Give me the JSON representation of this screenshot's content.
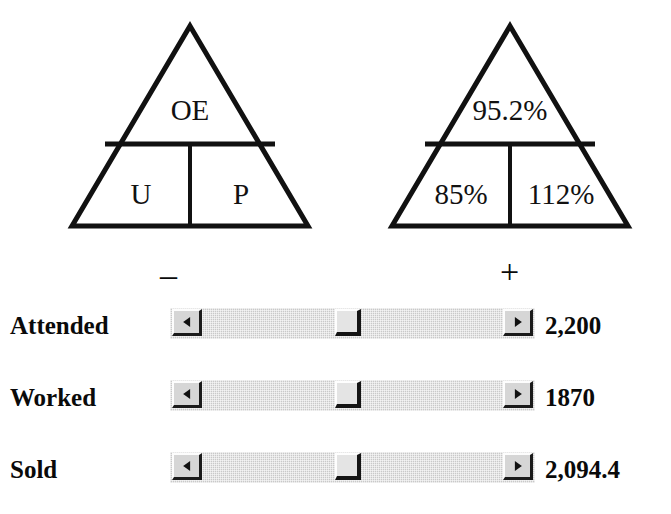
{
  "diagrams": [
    {
      "name": "productivity-pyramid-abbreviations",
      "top_cell": "OE",
      "bottom_left_cell": "U",
      "bottom_right_cell": "P"
    },
    {
      "name": "productivity-pyramid-values",
      "top_cell": "95.2%",
      "bottom_left_cell": "85%",
      "bottom_right_cell": "112%"
    }
  ],
  "sliders": {
    "minus_sign": "–",
    "plus_sign": "+",
    "left_arrow_icon": "triangle-left-icon",
    "right_arrow_icon": "triangle-right-icon",
    "rows": [
      {
        "label": "Attended",
        "value": "2,200"
      },
      {
        "label": "Worked",
        "value": "1870"
      },
      {
        "label": "Sold",
        "value": "2,094.4"
      }
    ]
  },
  "colors": {
    "ink": "#0a0a0a",
    "slider_track": "#c9c9c9",
    "slider_button_face": "#d6d6d6",
    "slider_thumb_face": "#e4e4e4",
    "slider_shadow": "#1b1b1b",
    "slider_highlight": "#fdfdfd",
    "background": "#ffffff"
  }
}
